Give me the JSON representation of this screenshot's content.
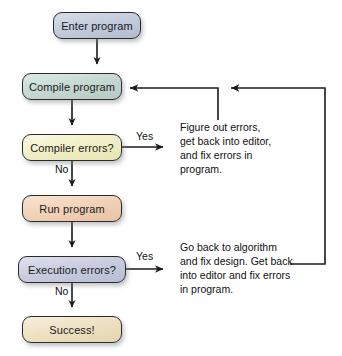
{
  "diagram": {
    "background": "#ffffff",
    "line_color": "#1a1a1a",
    "nodes": [
      {
        "id": "enter-program",
        "label": "Enter program",
        "shape": "rounded-rectangle",
        "fill": "#b9c2d4",
        "fill_light": "#d8dee8",
        "border": "#2b2b2b",
        "x": 53,
        "y": 12,
        "w": 88,
        "h": 27
      },
      {
        "id": "compile-program",
        "label": "Compile program",
        "shape": "rounded-rectangle",
        "fill": "#bdd2cd",
        "fill_light": "#dcebe6",
        "border": "#2b2b2b",
        "x": 22,
        "y": 73,
        "w": 100,
        "h": 27
      },
      {
        "id": "compiler-errors",
        "label": "Compiler errors?",
        "shape": "rounded-rectangle",
        "fill": "#efeec4",
        "fill_light": "#faf9e2",
        "border": "#2b2b2b",
        "x": 22,
        "y": 134,
        "w": 100,
        "h": 27
      },
      {
        "id": "run-program",
        "label": "Run program",
        "shape": "rounded-rectangle",
        "fill": "#f0cfb4",
        "fill_light": "#f8e4d2",
        "border": "#2b2b2b",
        "x": 22,
        "y": 195,
        "w": 100,
        "h": 27
      },
      {
        "id": "execution-errors",
        "label": "Execution errors?",
        "shape": "rounded-rectangle",
        "fill": "#bfc3d6",
        "fill_light": "#dee1ec",
        "border": "#2b2b2b",
        "x": 18,
        "y": 256,
        "w": 108,
        "h": 27
      },
      {
        "id": "success",
        "label": "Success!",
        "shape": "rounded-rectangle",
        "fill": "#eddfc0",
        "fill_light": "#f7eedb",
        "border": "#2b2b2b",
        "x": 22,
        "y": 316,
        "w": 100,
        "h": 27
      }
    ],
    "edge_labels": [
      {
        "id": "compiler-errors-yes",
        "text": "Yes",
        "x": 136,
        "y": 130
      },
      {
        "id": "compiler-errors-no",
        "text": "No",
        "x": 55,
        "y": 163
      },
      {
        "id": "execution-errors-yes",
        "text": "Yes",
        "x": 136,
        "y": 250
      },
      {
        "id": "execution-errors-no",
        "text": "No",
        "x": 55,
        "y": 285
      }
    ],
    "notes": [
      {
        "id": "compiler-error-note",
        "text": "Figure out errors,\nget back into editor,\nand fix errors in\nprogram.",
        "x": 180,
        "y": 120,
        "w": 135
      },
      {
        "id": "execution-error-note",
        "text": "Go back to algorithm\nand fix design. Get back\ninto editor and fix errors\nin program.",
        "x": 180,
        "y": 240,
        "w": 150
      }
    ],
    "connectors": [
      {
        "id": "enter-to-compile",
        "type": "arrow-down"
      },
      {
        "id": "compile-to-compiler-errors",
        "type": "arrow-down"
      },
      {
        "id": "compiler-errors-to-run",
        "type": "arrow-down"
      },
      {
        "id": "run-to-execution-errors",
        "type": "arrow-down"
      },
      {
        "id": "execution-errors-to-success",
        "type": "arrow-down"
      },
      {
        "id": "compiler-errors-yes-branch",
        "type": "arrow-right"
      },
      {
        "id": "execution-errors-yes-branch",
        "type": "arrow-right"
      },
      {
        "id": "compiler-errors-feedback-loop",
        "type": "loop-to-compile"
      },
      {
        "id": "execution-errors-feedback-loop",
        "type": "loop-to-compile"
      }
    ]
  }
}
